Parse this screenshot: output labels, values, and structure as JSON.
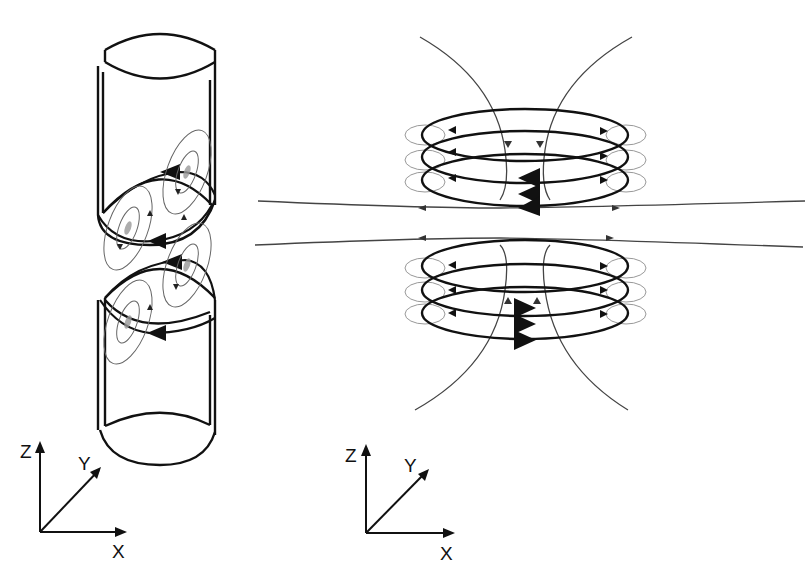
{
  "figure": {
    "panels": [
      {
        "id": "left",
        "description": "Two coaxial cylindrical sheets with circulating surface currents and field loops around the edges",
        "axes": {
          "z_label": "Z",
          "y_label": "Y",
          "x_label": "X"
        }
      },
      {
        "id": "right",
        "description": "Two stacked triple-turn coils with magnetic field lines",
        "axes": {
          "z_label": "Z",
          "y_label": "Y",
          "x_label": "X"
        }
      }
    ],
    "colors": {
      "stroke_main": "#111111",
      "stroke_field": "#555555",
      "stroke_faint": "#999999",
      "background": "#ffffff"
    }
  }
}
